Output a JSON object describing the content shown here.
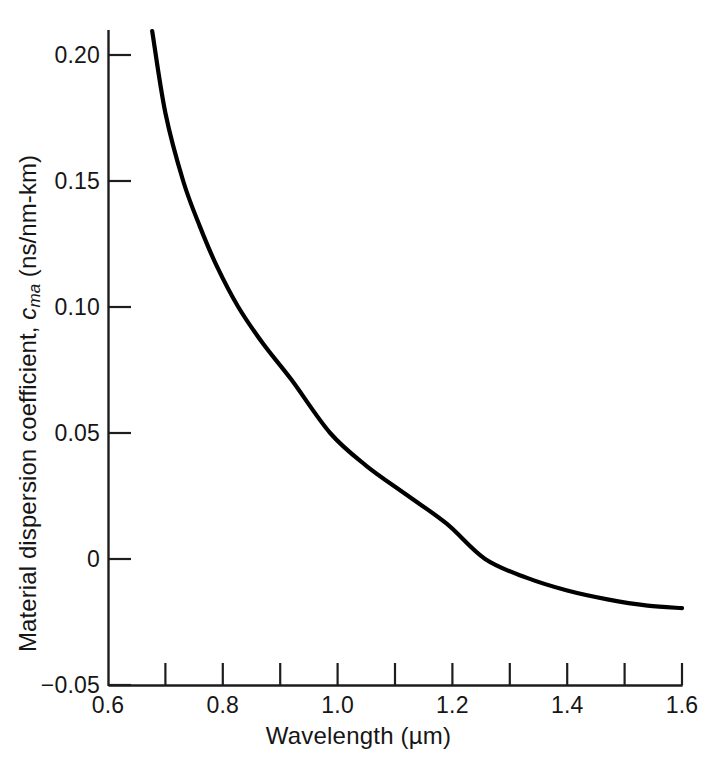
{
  "chart_data": {
    "type": "line",
    "title": "",
    "xlabel": "Wavelength (µm)",
    "ylabel": "Material dispersion coefficient, c_ma (ns/nm-km)",
    "ylabel_parts": {
      "lead": "Material dispersion coefficient, ",
      "symbol": "c",
      "subscript": "ma",
      "units": " (ns/nm-km)"
    },
    "xlim": [
      0.6,
      1.6
    ],
    "ylim": [
      -0.05,
      0.215
    ],
    "grid": false,
    "legend": null,
    "xticks": [
      0.6,
      0.8,
      1.0,
      1.2,
      1.4,
      1.6
    ],
    "xtick_labels": [
      "0.6",
      "0.8",
      "1.0",
      "1.2",
      "1.4",
      "1.6"
    ],
    "xminor_ticks": [
      0.7,
      0.9,
      1.1,
      1.3,
      1.5
    ],
    "yticks": [
      -0.05,
      0,
      0.05,
      0.1,
      0.15,
      0.2
    ],
    "ytick_labels": [
      "−0.05",
      "0",
      "0.05",
      "0.10",
      "0.15",
      "0.20"
    ],
    "series": [
      {
        "name": "Material dispersion coefficient",
        "color": "#000000",
        "x": [
          0.677,
          0.7,
          0.731,
          0.76,
          0.79,
          0.827,
          0.87,
          0.92,
          0.987,
          1.05,
          1.12,
          1.19,
          1.257,
          1.33,
          1.4,
          1.47,
          1.54,
          1.6
        ],
        "y": [
          0.2095,
          0.177,
          0.15,
          0.132,
          0.116,
          0.1,
          0.0855,
          0.071,
          0.05,
          0.037,
          0.0255,
          0.014,
          0.0,
          -0.0075,
          -0.0125,
          -0.016,
          -0.0185,
          -0.0195
        ]
      }
    ]
  },
  "axes_geometry": {
    "x_px_min": 108,
    "x_px_max": 682,
    "y_px_zero": 559,
    "y_px_per_unit": 2520,
    "y_px_top": 56,
    "y_px_bottom": 686
  }
}
